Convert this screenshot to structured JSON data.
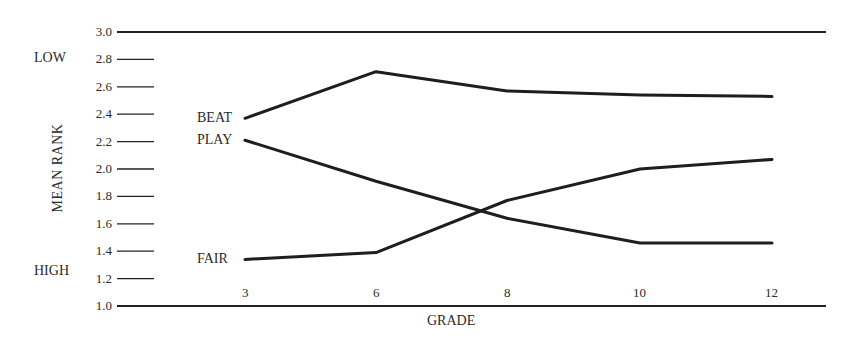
{
  "chart_data": {
    "type": "line",
    "title": "",
    "xlabel": "GRADE",
    "ylabel": "MEAN RANK",
    "y_annotations": {
      "top": "LOW",
      "bottom": "HIGH"
    },
    "x": [
      "3",
      "6",
      "8",
      "10",
      "12"
    ],
    "ylim": [
      1.0,
      3.0
    ],
    "yticks": [
      "3.0",
      "2.8",
      "2.6",
      "2.4",
      "2.2",
      "2.0",
      "1.8",
      "1.6",
      "1.4",
      "1.2",
      "1.0"
    ],
    "grid": false,
    "legend": "inline labels at line starts",
    "series": [
      {
        "name": "BEAT",
        "values": [
          2.37,
          2.71,
          2.57,
          2.54,
          2.53
        ]
      },
      {
        "name": "PLAY",
        "values": [
          2.21,
          1.91,
          1.64,
          1.46,
          1.46
        ]
      },
      {
        "name": "FAIR",
        "values": [
          1.34,
          1.39,
          1.77,
          2.0,
          2.07
        ]
      }
    ]
  }
}
